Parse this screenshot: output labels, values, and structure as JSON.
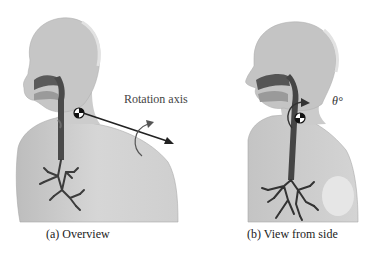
{
  "figure": {
    "panels": [
      {
        "id": "a",
        "caption": "(a) Overview",
        "annotation_label": "Rotation axis",
        "elements": [
          "human-torso-model",
          "airway",
          "bronchial-tree",
          "rotation-center-marker",
          "rotation-axis-arrow",
          "rotation-direction-arrow"
        ]
      },
      {
        "id": "b",
        "caption": "(b) View from side",
        "annotation_label": "θ°",
        "elements": [
          "human-torso-model",
          "airway",
          "bronchial-tree",
          "rotation-center-marker",
          "rotation-direction-arrow"
        ]
      }
    ],
    "colors": {
      "body": "#c8c8c8",
      "body_light": "#dcdcdc",
      "airway": "#4a4a4a",
      "arrow": "#222222",
      "background": "#ffffff"
    }
  }
}
